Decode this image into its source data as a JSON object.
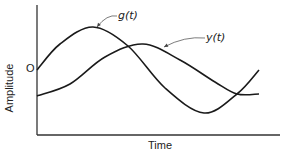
{
  "chart_data": {
    "type": "line",
    "title": "",
    "xlabel": "Time",
    "ylabel": "Amplitude",
    "y_origin_label": "O",
    "grid": false,
    "legend": "inline annotations with leader arrows",
    "series": [
      {
        "name": "g(t)",
        "description": "sinusoid starting at origin level, peaks early, dips to minimum, rises again",
        "points_px": [
          [
            37,
            70
          ],
          [
            60,
            44
          ],
          [
            93,
            27
          ],
          [
            128,
            46
          ],
          [
            165,
            88
          ],
          [
            204,
            113
          ],
          [
            237,
            94
          ],
          [
            259,
            70
          ]
        ]
      },
      {
        "name": "y(t)",
        "description": "delayed, lower-starting sinusoid; peaks later and flattens at end",
        "points_px": [
          [
            37,
            96
          ],
          [
            70,
            84
          ],
          [
            105,
            57
          ],
          [
            143,
            44
          ],
          [
            180,
            60
          ],
          [
            215,
            82
          ],
          [
            237,
            94
          ],
          [
            259,
            94
          ]
        ]
      }
    ],
    "annotations": [
      {
        "text": "g(t)",
        "label_px": [
          118,
          18
        ],
        "arrow_to_px": [
          97,
          27
        ]
      },
      {
        "text": "y(t)",
        "label_px": [
          206,
          40
        ],
        "arrow_to_px": [
          164,
          47
        ]
      }
    ],
    "axes_px": {
      "origin": [
        37,
        135
      ],
      "y_top": [
        37,
        5
      ],
      "x_right": [
        280,
        135
      ]
    }
  },
  "labels": {
    "x_axis": "Time",
    "y_axis": "Amplitude",
    "zero": "O",
    "g": "g(t)",
    "y": "y(t)"
  }
}
